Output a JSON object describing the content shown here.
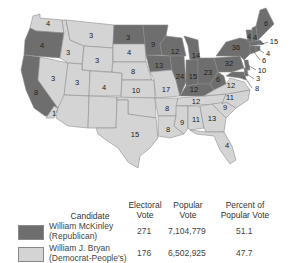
{
  "map": {
    "title": "Election of 1896",
    "colors": {
      "republican": "#6e6e6e",
      "democrat": "#d4d4d4"
    },
    "states": [
      {
        "name": "Washington",
        "ev": "4",
        "party": "D"
      },
      {
        "name": "Oregon",
        "ev": "4",
        "party": "R"
      },
      {
        "name": "California",
        "ev": "8",
        "party": "R"
      },
      {
        "name": "California-split",
        "ev": "1",
        "party": "D"
      },
      {
        "name": "Idaho",
        "ev": "3",
        "party": "D"
      },
      {
        "name": "Nevada",
        "ev": "3",
        "party": "D"
      },
      {
        "name": "Montana",
        "ev": "3",
        "party": "D"
      },
      {
        "name": "Wyoming",
        "ev": "3",
        "party": "D"
      },
      {
        "name": "Utah",
        "ev": "3",
        "party": "D"
      },
      {
        "name": "Colorado",
        "ev": "4",
        "party": "D"
      },
      {
        "name": "North Dakota",
        "ev": "3",
        "party": "R"
      },
      {
        "name": "South Dakota",
        "ev": "4",
        "party": "D"
      },
      {
        "name": "Nebraska",
        "ev": "8",
        "party": "D"
      },
      {
        "name": "Kansas",
        "ev": "10",
        "party": "D"
      },
      {
        "name": "Texas",
        "ev": "15",
        "party": "D"
      },
      {
        "name": "Minnesota",
        "ev": "9",
        "party": "R"
      },
      {
        "name": "Iowa",
        "ev": "13",
        "party": "R"
      },
      {
        "name": "Missouri",
        "ev": "17",
        "party": "D"
      },
      {
        "name": "Arkansas",
        "ev": "8",
        "party": "D"
      },
      {
        "name": "Louisiana",
        "ev": "8",
        "party": "D"
      },
      {
        "name": "Wisconsin",
        "ev": "12",
        "party": "R"
      },
      {
        "name": "Illinois",
        "ev": "24",
        "party": "R"
      },
      {
        "name": "Michigan",
        "ev": "14",
        "party": "R"
      },
      {
        "name": "Indiana",
        "ev": "15",
        "party": "R"
      },
      {
        "name": "Ohio",
        "ev": "23",
        "party": "R"
      },
      {
        "name": "Kentucky",
        "ev": "12",
        "party": "R"
      },
      {
        "name": "Tennessee",
        "ev": "12",
        "party": "D"
      },
      {
        "name": "Mississippi",
        "ev": "9",
        "party": "D"
      },
      {
        "name": "Alabama",
        "ev": "11",
        "party": "D"
      },
      {
        "name": "Georgia",
        "ev": "13",
        "party": "D"
      },
      {
        "name": "Florida",
        "ev": "4",
        "party": "D"
      },
      {
        "name": "South Carolina",
        "ev": "9",
        "party": "D"
      },
      {
        "name": "North Carolina",
        "ev": "11",
        "party": "D"
      },
      {
        "name": "Virginia",
        "ev": "12",
        "party": "D"
      },
      {
        "name": "West Virginia",
        "ev": "6",
        "party": "R"
      },
      {
        "name": "Pennsylvania",
        "ev": "32",
        "party": "R"
      },
      {
        "name": "New York",
        "ev": "36",
        "party": "R"
      },
      {
        "name": "Vermont",
        "ev": "4",
        "party": "R"
      },
      {
        "name": "New Hampshire",
        "ev": "4",
        "party": "R"
      },
      {
        "name": "Maine",
        "ev": "6",
        "party": "R"
      },
      {
        "name": "Massachusetts",
        "ev": "15",
        "party": "R"
      },
      {
        "name": "Rhode Island",
        "ev": "4",
        "party": "R"
      },
      {
        "name": "Connecticut",
        "ev": "6",
        "party": "R"
      },
      {
        "name": "New Jersey",
        "ev": "10",
        "party": "R"
      },
      {
        "name": "Delaware",
        "ev": "3",
        "party": "R"
      },
      {
        "name": "Maryland",
        "ev": "8",
        "party": "R"
      }
    ]
  },
  "table": {
    "headers": {
      "candidate": "Candidate",
      "electoral_1": "Electoral",
      "electoral_2": "Vote",
      "popular_1": "Popular",
      "popular_2": "Vote",
      "percent_1": "Percent of",
      "percent_2": "Popular Vote"
    },
    "rows": [
      {
        "name": "William McKinley",
        "party": "(Republican)",
        "electoral": "271",
        "popular": "7,104,779",
        "percent": "51.1",
        "color": "#6e6e6e"
      },
      {
        "name": "William J. Bryan",
        "party": "(Democrat-People's)",
        "electoral": "176",
        "popular": "6,502,925",
        "percent": "47.7",
        "color": "#d4d4d4"
      }
    ]
  }
}
